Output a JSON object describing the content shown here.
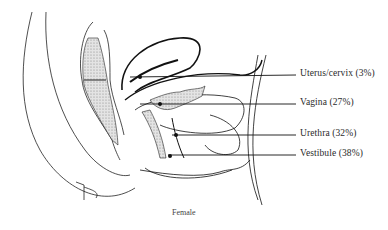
{
  "figure": {
    "caption": "Female",
    "stroke_color": "#222222",
    "shade_color": "#d6d6d6"
  },
  "labels": [
    {
      "id": "uterus-cervix",
      "text": "Uterus/cervix (3%)",
      "percent": 3
    },
    {
      "id": "vagina",
      "text": "Vagina (27%)",
      "percent": 27
    },
    {
      "id": "urethra",
      "text": "Urethra (32%)",
      "percent": 32
    },
    {
      "id": "vestibule",
      "text": "Vestibule (38%)",
      "percent": 38
    }
  ]
}
